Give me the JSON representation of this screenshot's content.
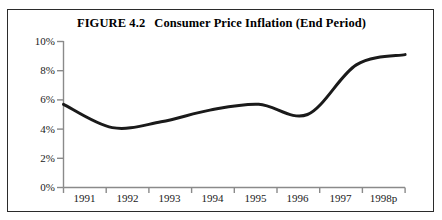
{
  "figure": {
    "number_label": "FIGURE 4.2",
    "title": "Consumer Price Inflation (End Period)",
    "frame_color": "#2b2b2b",
    "background": "#ffffff"
  },
  "chart_data": {
    "type": "line",
    "xlabel": "",
    "ylabel": "",
    "categories": [
      "1991",
      "1992",
      "1993",
      "1994",
      "1995",
      "1996",
      "1997",
      "1998p"
    ],
    "x": [
      "1991",
      "1992",
      "1993",
      "1994",
      "1995",
      "1996",
      "1997",
      "1998p"
    ],
    "values": [
      5.7,
      4.1,
      4.5,
      5.3,
      5.7,
      5.0,
      8.4,
      9.1
    ],
    "series": [
      {
        "name": "Consumer Price Inflation (End Period)",
        "values": [
          5.7,
          4.1,
          4.5,
          5.3,
          5.7,
          5.0,
          8.4,
          9.1
        ],
        "color": "#1a1a1a",
        "line_width": 3,
        "smoothing": "spline"
      }
    ],
    "ylim": [
      0,
      10
    ],
    "yticks": [
      0,
      2,
      4,
      6,
      8,
      10
    ],
    "ytick_labels": [
      "0%",
      "2%",
      "4%",
      "6%",
      "8%",
      "10%"
    ],
    "xtick_labels": [
      "1991",
      "1992",
      "1993",
      "1994",
      "1995",
      "1996",
      "1997",
      "1998p"
    ],
    "y_unit": "%",
    "grid": false,
    "legend": null,
    "legend_position": "none",
    "axis_color": "#8a8a8a",
    "tick_style": "outward"
  }
}
